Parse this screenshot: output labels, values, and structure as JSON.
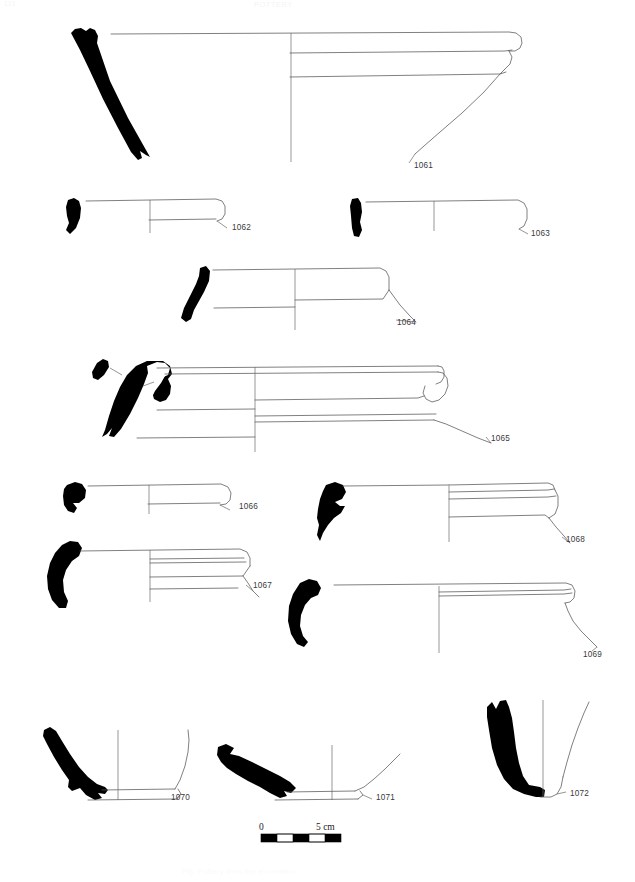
{
  "page": {
    "header_left": "111",
    "header_center": "POTTERY",
    "footer_caption": "Fig. Pottery from the excavation",
    "background_color": "#ffffff",
    "ink_color": "#555555",
    "sherd_color": "#000000"
  },
  "scale_bar": {
    "start_label": "0",
    "end_label": "5 cm",
    "segments": 5,
    "unit": "cm",
    "length_cm": 5
  },
  "figures": [
    {
      "id": "1061",
      "label": "1061",
      "type": "rim-profile",
      "description": "Large open bowl with thickened everted rim and two exterior grooves",
      "row": 1,
      "column": "full"
    },
    {
      "id": "1062",
      "label": "1062",
      "type": "rim-profile",
      "description": "Shallow dish with simple rounded rim",
      "row": 2,
      "column": "left"
    },
    {
      "id": "1063",
      "label": "1063",
      "type": "rim-profile",
      "description": "Shallow plate with thin everted rim",
      "row": 2,
      "column": "right"
    },
    {
      "id": "1064",
      "label": "1064",
      "type": "rim-profile",
      "description": "Bowl with flattened rim and carinated wall",
      "row": 3,
      "column": "center"
    },
    {
      "id": "1065",
      "label": "1065",
      "type": "rim-profile",
      "description": "Large basin with hooked rolled rim and detached sherd fragment",
      "row": 4,
      "column": "full"
    },
    {
      "id": "1066",
      "label": "1066",
      "type": "rim-profile",
      "description": "Small bowl with rounded thickened rim",
      "row": 5,
      "column": "left"
    },
    {
      "id": "1067",
      "label": "1067",
      "type": "rim-profile",
      "description": "Bowl with grooved band below rim",
      "row": 6,
      "column": "left"
    },
    {
      "id": "1068",
      "label": "1068",
      "type": "rim-profile",
      "description": "Bowl with banded rim and two horizontal grooves",
      "row": 5,
      "column": "right"
    },
    {
      "id": "1069",
      "label": "1069",
      "type": "rim-profile",
      "description": "Dish with rolled rim and narrow groove",
      "row": 6,
      "column": "right"
    },
    {
      "id": "1070",
      "label": "1070",
      "type": "base-profile",
      "description": "Flat base with flaring wall",
      "row": 7,
      "column": "left"
    },
    {
      "id": "1071",
      "label": "1071",
      "type": "base-profile",
      "description": "Shallow flat base with low wall",
      "row": 7,
      "column": "center"
    },
    {
      "id": "1072",
      "label": "1072",
      "type": "base-profile",
      "description": "Thick disc base with steep wall",
      "row": 7,
      "column": "right"
    }
  ]
}
